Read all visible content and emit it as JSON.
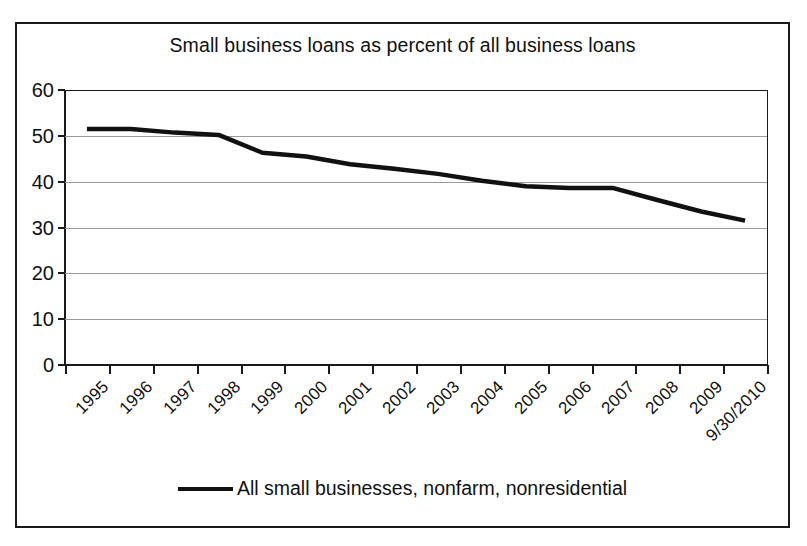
{
  "chart_data": {
    "type": "line",
    "title": "Small business loans as percent of all business loans",
    "xlabel": "",
    "ylabel": "",
    "ylim": [
      0,
      60
    ],
    "yticks": [
      0,
      10,
      20,
      30,
      40,
      50,
      60
    ],
    "ytick_labels": [
      "0",
      "10",
      "20",
      "30",
      "40",
      "50",
      "60"
    ],
    "grid": "horizontal",
    "legend_position": "bottom-center",
    "categories": [
      "1995",
      "1996",
      "1997",
      "1998",
      "1999",
      "2000",
      "2001",
      "2002",
      "2003",
      "2004",
      "2005",
      "2006",
      "2007",
      "2008",
      "2009",
      "9/30/2010"
    ],
    "series": [
      {
        "name": "All small businesses, nonfarm, nonresidential",
        "color": "#111111",
        "values": [
          51.5,
          51.5,
          50.7,
          50.2,
          46.3,
          45.5,
          43.8,
          42.8,
          41.7,
          40.2,
          39.0,
          38.6,
          38.6,
          36.0,
          33.5,
          31.5
        ]
      }
    ]
  },
  "legend": {
    "entries": [
      {
        "label": "All small businesses, nonfarm, nonresidential"
      }
    ]
  }
}
